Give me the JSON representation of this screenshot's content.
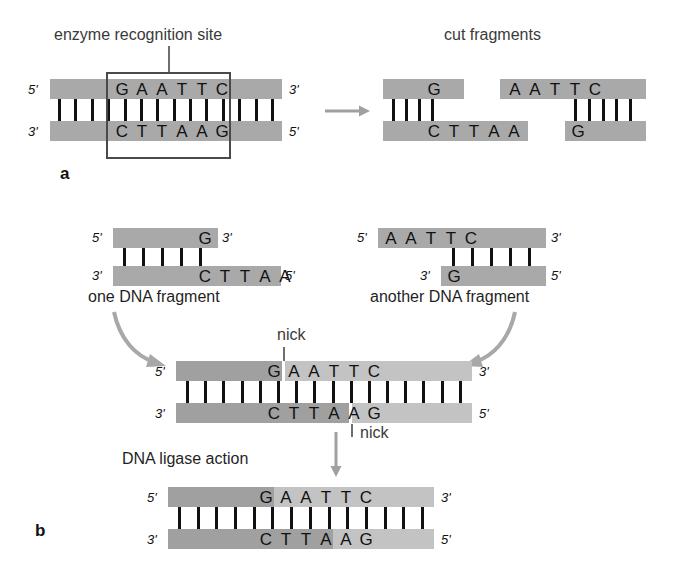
{
  "figure": {
    "panels": [
      {
        "letter": "a",
        "name": "restriction-digest"
      },
      {
        "letter": "b",
        "name": "ligation"
      }
    ]
  },
  "colors": {
    "strand": "#a9a9a9",
    "strand_light": "#c3c3c3",
    "bond": "#111111",
    "box_outline": "#4a4a4a",
    "arrow": "#a0a0a0",
    "text": "#1a1a1a",
    "caption": "#3a3a3a",
    "background": "#ffffff"
  },
  "labels": {
    "enzyme_recognition_site": "enzyme recognition site",
    "cut_fragments": "cut fragments",
    "one_dna_fragment": "one DNA fragment",
    "another_dna_fragment": "another DNA fragment",
    "dna_ligase_action": "DNA ligase action",
    "nick_top": "nick",
    "nick_bottom": "nick",
    "panel_a": "a",
    "panel_b": "b",
    "five_prime": "5'",
    "three_prime": "3'"
  },
  "sequences": {
    "recognition_top": "GAATTC",
    "recognition_bottom": "CTTAAG",
    "cut_left_top": "G",
    "cut_left_bottom": "CTTAA",
    "cut_right_top": "AATTC",
    "cut_right_bottom": "G",
    "fragment_one_top": "G",
    "fragment_one_bottom": "CTTAA",
    "fragment_two_top": "AATTC",
    "fragment_two_bottom": "G",
    "ligated_top": "GAATTC",
    "ligated_bottom": "CTTAAG",
    "sealed_top": "GAATTC",
    "sealed_bottom": "CTTAAG"
  },
  "structures": {
    "panel_a_duplex": {
      "name": "intact-duplex",
      "bond_count": 14,
      "recognition_bond_count": 6,
      "top_end_left": "5'",
      "top_end_right": "3'",
      "bottom_end_left": "3'",
      "bottom_end_right": "5'"
    },
    "cut_fragment_left": {
      "name": "left-cut-fragment",
      "bond_count": 4,
      "overhang": "CTTAA",
      "overhang_type": "5'-sticky-end"
    },
    "cut_fragment_right": {
      "name": "right-cut-fragment",
      "bond_count": 5,
      "overhang": "AATTC",
      "overhang_type": "5'-sticky-end"
    },
    "fragment_one": {
      "name": "one-dna-fragment",
      "bond_count": 5,
      "top_end_left": "5'",
      "top_end_right": "3'",
      "bottom_end_left": "3'",
      "bottom_end_right": "5'"
    },
    "fragment_two": {
      "name": "another-dna-fragment",
      "bond_count": 5,
      "top_end_left": "5'",
      "top_end_right": "3'",
      "bottom_end_left": "3'",
      "bottom_end_right": "5'"
    },
    "nicked_duplex": {
      "name": "annealed-nicked-duplex",
      "bond_count": 16,
      "nicks": 2,
      "top_end_left": "5'",
      "top_end_right": "3'",
      "bottom_end_left": "3'",
      "bottom_end_right": "5'"
    },
    "sealed_duplex": {
      "name": "ligated-sealed-duplex",
      "bond_count": 14,
      "nicks": 0,
      "top_end_left": "5'",
      "top_end_right": "3'",
      "bottom_end_left": "3'",
      "bottom_end_right": "5'"
    }
  }
}
